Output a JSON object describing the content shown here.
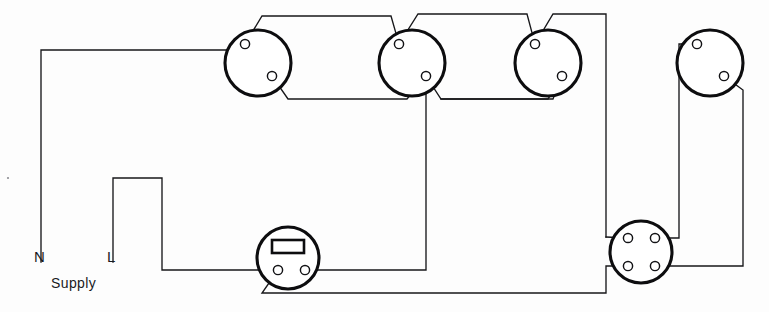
{
  "diagram": {
    "kind": "electrical-wiring-schematic",
    "background_color": "#fdfdfd",
    "wire_color": "#17171a",
    "component_outline_color": "#0d0d0f"
  },
  "labels": {
    "neutral": "N",
    "live": "L",
    "supply": "Supply"
  },
  "components": [
    {
      "id": "lamp-1",
      "name": "ceiling-rose-1",
      "type": "lamp",
      "cx": 258,
      "cy": 63,
      "r": 33,
      "terminals": [
        {
          "name": "lamp-1-terminal-top",
          "cx": 245,
          "cy": 44,
          "r": 4.6
        },
        {
          "name": "lamp-1-terminal-bottom",
          "cx": 272,
          "cy": 76,
          "r": 4.6
        }
      ]
    },
    {
      "id": "lamp-2",
      "name": "ceiling-rose-2",
      "type": "lamp",
      "cx": 412,
      "cy": 63,
      "r": 33,
      "terminals": [
        {
          "name": "lamp-2-terminal-top",
          "cx": 399,
          "cy": 44,
          "r": 4.6
        },
        {
          "name": "lamp-2-terminal-bottom",
          "cx": 426,
          "cy": 76,
          "r": 4.6
        }
      ]
    },
    {
      "id": "lamp-3",
      "name": "ceiling-rose-3",
      "type": "lamp",
      "cx": 548,
      "cy": 63,
      "r": 33,
      "terminals": [
        {
          "name": "lamp-3-terminal-top",
          "cx": 535,
          "cy": 44,
          "r": 4.6
        },
        {
          "name": "lamp-3-terminal-bottom",
          "cx": 562,
          "cy": 76,
          "r": 4.6
        }
      ]
    },
    {
      "id": "lamp-4",
      "name": "ceiling-rose-4",
      "type": "lamp",
      "cx": 710,
      "cy": 63,
      "r": 33,
      "terminals": [
        {
          "name": "lamp-4-terminal-top",
          "cx": 697,
          "cy": 44,
          "r": 4.6
        },
        {
          "name": "lamp-4-terminal-bottom",
          "cx": 724,
          "cy": 76,
          "r": 4.6
        }
      ]
    },
    {
      "id": "switch-1",
      "name": "one-way-switch",
      "type": "switch",
      "cx": 288,
      "cy": 258,
      "r": 31,
      "rocker": {
        "x": 272,
        "y": 240,
        "width": 32,
        "height": 13
      },
      "terminals": [
        {
          "name": "switch-terminal-left",
          "cx": 278,
          "cy": 270,
          "r": 4.6
        },
        {
          "name": "switch-terminal-right",
          "cx": 305,
          "cy": 270,
          "r": 4.6
        }
      ]
    },
    {
      "id": "junction-1",
      "name": "four-terminal-junction-box",
      "type": "junction-box",
      "cx": 641,
      "cy": 252,
      "r": 31,
      "terminals": [
        {
          "name": "junction-terminal-top-left",
          "cx": 628,
          "cy": 238,
          "r": 4.6
        },
        {
          "name": "junction-terminal-top-right",
          "cx": 655,
          "cy": 238,
          "r": 4.6
        },
        {
          "name": "junction-terminal-bottom-left",
          "cx": 628,
          "cy": 266,
          "r": 4.6
        },
        {
          "name": "junction-terminal-bottom-right",
          "cx": 655,
          "cy": 266,
          "r": 4.6
        }
      ]
    }
  ],
  "wires": [
    {
      "name": "neutral-supply-run",
      "d": "M 41 262 L 41 50 L 228 50 L 245 44"
    },
    {
      "name": "lamp1-top-to-lamp2-top-link",
      "d": "M 245 44 L 262 16 L 391 16 L 399 44"
    },
    {
      "name": "lamp1-bottom-to-lamp2-bottom-link",
      "d": "M 272 76 L 288 99 L 407 99 L 426 76"
    },
    {
      "name": "lamp2-top-to-lamp3-top-link",
      "d": "M 399 44 L 418 14 L 527 14 L 535 44"
    },
    {
      "name": "lamp2-bottom-to-lamp3-bottom-link",
      "d": "M 426 76 L 441 99 L 553 99 L 562 76"
    },
    {
      "name": "lamp3-top-to-right-riser",
      "d": "M 535 44 L 553 14 L 606 14 L 606 237"
    },
    {
      "name": "lamp3-bottom-to-left-return",
      "d": "M 562 76 L 548 99 L 441 99"
    },
    {
      "name": "lamp2-bottom-dropper-to-switch",
      "d": "M 426 76 L 426 270 L 305 270"
    },
    {
      "name": "live-supply-run-to-switch",
      "d": "M 113 262 L 113 178 L 162 178 L 162 270 L 278 270"
    },
    {
      "name": "switch-left-terminal-to-bottom-loop",
      "d": "M 278 270 L 262 293 L 606 293 L 606 266 L 628 266"
    },
    {
      "name": "right-riser-into-junction-top-left",
      "d": "M 606 237 L 628 238"
    },
    {
      "name": "lamp4-top-terminal-dropper",
      "d": "M 697 44 L 679 44 L 679 238 L 655 238"
    },
    {
      "name": "lamp4-bottom-terminal-dropper",
      "d": "M 724 76 L 743 90 L 743 266 L 655 266"
    }
  ]
}
